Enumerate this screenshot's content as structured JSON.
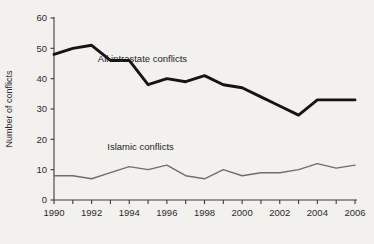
{
  "chart_data": {
    "type": "line",
    "title": "",
    "xlabel": "",
    "ylabel": "Number of conflicts",
    "xlim": [
      1990,
      2006
    ],
    "ylim": [
      0,
      60
    ],
    "grid": false,
    "legend_position": "inline-annotations",
    "x": [
      1990,
      1991,
      1992,
      1993,
      1994,
      1995,
      1996,
      1997,
      1998,
      1999,
      2000,
      2001,
      2002,
      2003,
      2004,
      2005,
      2006
    ],
    "xticks": [
      1990,
      1991,
      1992,
      1993,
      1994,
      1995,
      1996,
      1997,
      1998,
      1999,
      2000,
      2001,
      2002,
      2003,
      2004,
      2005,
      2006
    ],
    "xtick_labels": [
      "1990",
      "",
      "1992",
      "",
      "1994",
      "",
      "1996",
      "",
      "1998",
      "",
      "2000",
      "",
      "2002",
      "",
      "2004",
      "",
      "2006"
    ],
    "yticks": [
      0,
      10,
      20,
      30,
      40,
      50,
      60
    ],
    "ytick_labels": [
      "0",
      "10",
      "20",
      "30",
      "40",
      "50",
      "60"
    ],
    "series": [
      {
        "name": "All intrastate conflicts",
        "color": "#141414",
        "linewidth": 2.9,
        "label_x": 1994.7,
        "label_y": 45.5,
        "values": [
          48,
          50,
          51,
          46,
          46,
          38,
          40,
          39,
          41,
          38,
          37,
          34,
          31,
          28,
          33,
          33,
          33
        ]
      },
      {
        "name": "Islamic conflicts",
        "color": "#6e6e6e",
        "linewidth": 1.4,
        "label_x": 1994.6,
        "label_y": 16.5,
        "values": [
          8,
          8,
          7,
          9,
          11,
          10,
          11.5,
          8,
          7,
          10,
          8,
          9,
          9,
          10,
          12,
          10.5,
          11.5
        ]
      }
    ]
  }
}
